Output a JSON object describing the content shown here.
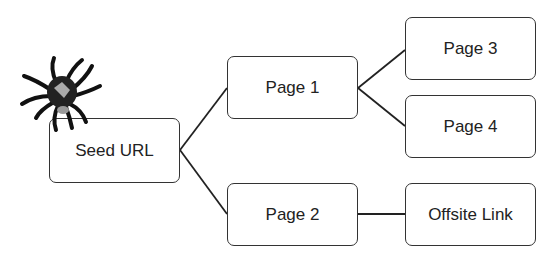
{
  "diagram": {
    "nodes": [
      {
        "id": "seed",
        "label": "Seed URL"
      },
      {
        "id": "page1",
        "label": "Page 1"
      },
      {
        "id": "page2",
        "label": "Page 2"
      },
      {
        "id": "page3",
        "label": "Page 3"
      },
      {
        "id": "page4",
        "label": "Page 4"
      },
      {
        "id": "offsite",
        "label": "Offsite Link"
      }
    ],
    "edges": [
      [
        "seed",
        "page1"
      ],
      [
        "seed",
        "page2"
      ],
      [
        "page1",
        "page3"
      ],
      [
        "page1",
        "page4"
      ],
      [
        "page2",
        "offsite"
      ]
    ],
    "icon": "spider-icon"
  }
}
